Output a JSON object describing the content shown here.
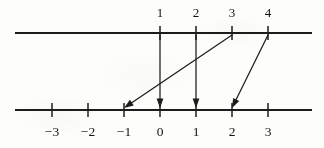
{
  "figure": {
    "kind": "number-line-mapping-diagram",
    "ink_color": "#1c1c1c",
    "paper_color": "#fdfdfc"
  },
  "upper_axis": {
    "name": "upper-number-line",
    "y": 33,
    "x_start": 15,
    "x_end": 312,
    "ticks": [
      {
        "label": "1",
        "x": 160
      },
      {
        "label": "2",
        "x": 196
      },
      {
        "label": "3",
        "x": 232
      },
      {
        "label": "4",
        "x": 268
      }
    ],
    "label_y": 17
  },
  "lower_axis": {
    "name": "lower-number-line",
    "y": 110,
    "x_start": 15,
    "x_end": 312,
    "ticks": [
      {
        "label": "−3",
        "x": 52
      },
      {
        "label": "−2",
        "x": 88
      },
      {
        "label": "−1",
        "x": 124
      },
      {
        "label": "0",
        "x": 160
      },
      {
        "label": "1",
        "x": 196
      },
      {
        "label": "2",
        "x": 232
      },
      {
        "label": "3",
        "x": 268
      }
    ],
    "label_y": 136
  },
  "mappings": [
    {
      "name": "arrow-1-to-0",
      "from_label": "1",
      "to_label": "0",
      "x1": 160,
      "y1": 35,
      "x2": 160,
      "y2": 108
    },
    {
      "name": "arrow-2-to-1",
      "from_label": "2",
      "to_label": "1",
      "x1": 196,
      "y1": 35,
      "x2": 196,
      "y2": 108
    },
    {
      "name": "arrow-3-to-neg1",
      "from_label": "3",
      "to_label": "−1",
      "x1": 232,
      "y1": 35,
      "x2": 124,
      "y2": 108
    },
    {
      "name": "arrow-4-to-2",
      "from_label": "4",
      "to_label": "2",
      "x1": 268,
      "y1": 35,
      "x2": 232,
      "y2": 108
    }
  ],
  "chart_data": {
    "type": "scatter",
    "title": "",
    "xlabel": "",
    "ylabel": "",
    "series": [
      {
        "name": "mapping",
        "x": [
          1,
          2,
          3,
          4
        ],
        "values": [
          0,
          1,
          -1,
          2
        ]
      }
    ],
    "upper_axis_ticks": [
      1,
      2,
      3,
      4
    ],
    "lower_axis_ticks": [
      -3,
      -2,
      -1,
      0,
      1,
      2,
      3
    ],
    "legend": "none",
    "grid": false
  }
}
